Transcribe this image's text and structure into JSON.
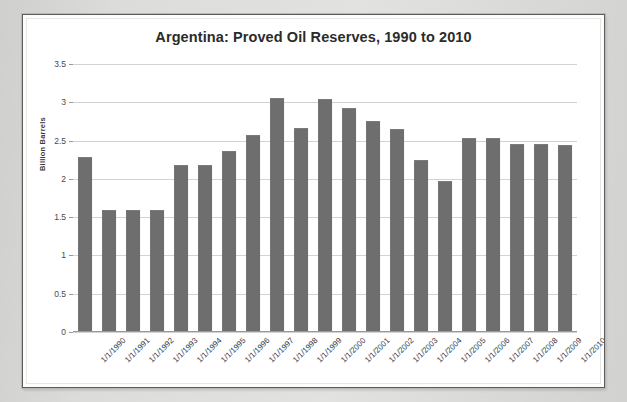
{
  "chart": {
    "title": "Argentina: Proved Oil Reserves, 1990 to 2010",
    "y_axis_title": "Billion Barrels",
    "bar_color": "#6e6e6e",
    "gridline_color": "#d2d2d2",
    "plot_background": "#ffffff",
    "frame_border_color": "#5c5c5c"
  },
  "chart_data": {
    "type": "bar",
    "title": "Argentina: Proved Oil Reserves, 1990 to 2010",
    "xlabel": "",
    "ylabel": "Billion Barrels",
    "ylim": [
      0,
      3.5
    ],
    "ytick_labels": [
      "0",
      "0.5",
      "1",
      "1.5",
      "2",
      "2.5",
      "3",
      "3.5"
    ],
    "ytick_values": [
      0,
      0.5,
      1,
      1.5,
      2,
      2.5,
      3,
      3.5
    ],
    "grid": true,
    "legend": false,
    "legend_position": "none",
    "categories": [
      "1/1/1990",
      "1/1/1991",
      "1/1/1992",
      "1/1/1993",
      "1/1/1994",
      "1/1/1995",
      "1/1/1996",
      "1/1/1997",
      "1/1/1998",
      "1/1/1999",
      "1/1/2000",
      "1/1/2001",
      "1/1/2002",
      "1/1/2003",
      "1/1/2004",
      "1/1/2005",
      "1/1/2006",
      "1/1/2007",
      "1/1/2008",
      "1/1/2009",
      "1/1/2010"
    ],
    "values": [
      2.28,
      1.6,
      1.6,
      1.59,
      2.18,
      2.18,
      2.37,
      2.57,
      3.05,
      2.66,
      3.04,
      2.92,
      2.76,
      2.65,
      2.25,
      1.97,
      2.54,
      2.54,
      2.45,
      2.45,
      2.44
    ]
  }
}
